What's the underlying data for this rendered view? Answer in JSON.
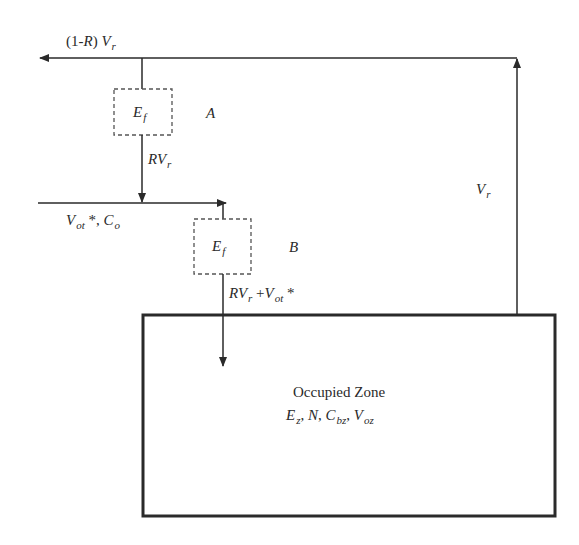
{
  "diagram": {
    "colors": {
      "line": "#2a2a2a",
      "dashed": "#555555",
      "box": "#2a2a2a",
      "background": "#ffffff"
    },
    "labels": {
      "exhaust_flow": {
        "prefix": "(1-",
        "var": "R",
        "suffix": ") ",
        "v": "V",
        "sub": "r"
      },
      "filter_a": {
        "e": "E",
        "sub": "f"
      },
      "filter_a_tag": "A",
      "recirc_flow": {
        "r": "R",
        "v": "V",
        "sub": "r"
      },
      "outdoor_flow": {
        "v": "V",
        "sub": "ot",
        "star": " *, ",
        "c": "C",
        "csub": "o"
      },
      "filter_b": {
        "e": "E",
        "sub": "f"
      },
      "filter_b_tag": "B",
      "supply_flow": {
        "r": "R",
        "v": "V",
        "sub": "r",
        "plus": " +",
        "v2": "V",
        "sub2": "ot",
        "star": " *"
      },
      "return_flow": {
        "v": "V",
        "sub": "r"
      },
      "zone": {
        "title": "Occupied Zone",
        "params": [
          {
            "name": "E",
            "sub": "z",
            "sep": ", "
          },
          {
            "name": "N",
            "sub": "",
            "sep": ", "
          },
          {
            "name": "C",
            "sub": "bz",
            "sep": ", "
          },
          {
            "name": "V",
            "sub": "oz",
            "sep": ""
          }
        ]
      }
    }
  }
}
